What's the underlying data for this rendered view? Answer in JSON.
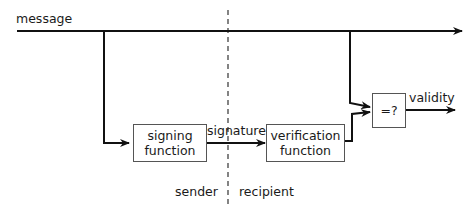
{
  "diagram": {
    "type": "flow",
    "labels": {
      "message": "message",
      "signature": "signature",
      "validity": "validity",
      "sender": "sender",
      "recipient": "recipient"
    },
    "nodes": [
      {
        "id": "signing",
        "line1": "signing",
        "line2": "function"
      },
      {
        "id": "verification",
        "line1": "verification",
        "line2": "function"
      },
      {
        "id": "compare",
        "label": "=?"
      }
    ],
    "edges": [
      {
        "from": "message",
        "to": "signing"
      },
      {
        "from": "signing",
        "to": "verification",
        "label": "signature"
      },
      {
        "from": "message",
        "to": "compare"
      },
      {
        "from": "verification",
        "to": "compare"
      },
      {
        "from": "compare",
        "to": "output",
        "label": "validity"
      }
    ],
    "divider": {
      "left": "sender",
      "right": "recipient",
      "style": "dashed"
    }
  }
}
